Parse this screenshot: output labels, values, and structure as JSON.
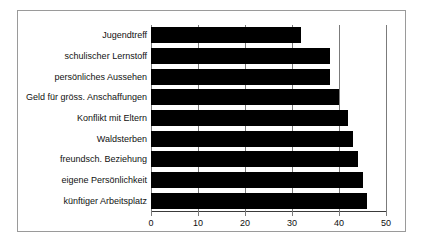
{
  "chart_data": {
    "type": "bar",
    "orientation": "horizontal",
    "title": "",
    "subtitle": "",
    "xlabel": "",
    "ylabel": "",
    "categories": [
      "Jugendtreff",
      "schulischer Lernstoff",
      "persönliches Aussehen",
      "Geld für gröss. Anschaffungen",
      "Konflikt mit Eltern",
      "Waldsterben",
      "freundsch. Beziehung",
      "eigene Persönlichkeit",
      "künftiger Arbeitsplatz"
    ],
    "values": [
      32,
      38,
      38,
      40,
      42,
      43,
      44,
      45,
      46
    ],
    "xlim": [
      0,
      50
    ],
    "xticks": [
      0,
      10,
      20,
      30,
      40,
      50
    ],
    "xtick_labels": [
      "0",
      "10",
      "20",
      "30",
      "40",
      "50"
    ],
    "grid": true,
    "grid_axis": "x",
    "legend": false,
    "bar_color": "#000000",
    "grid_color": "#7b7b7b",
    "frame_color": "#9a9a9a",
    "background_color": "#ffffff"
  }
}
